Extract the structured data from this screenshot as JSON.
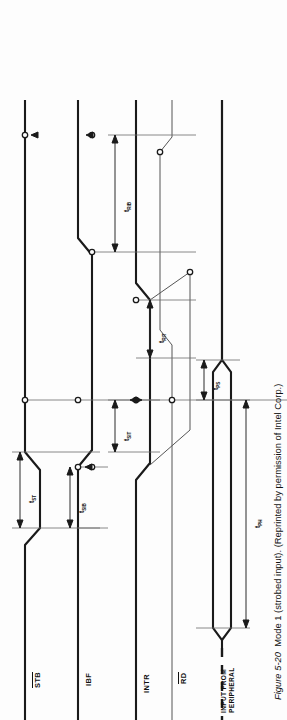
{
  "figure": {
    "number": "Figure 5-20",
    "title": "Mode 1 (strobed input).",
    "credit": "(Reprinted by permission of Intel Corp.)",
    "caption_full": "Figure 5-20   Mode 1 (strobed input). (Reprinted by permission of Intel Corp.)",
    "orientation": "rotated-90-ccw"
  },
  "signals": [
    {
      "id": "stb",
      "label": "STB",
      "overline": true,
      "kind": "waveform"
    },
    {
      "id": "ibf",
      "label": "IBF",
      "overline": false,
      "kind": "waveform"
    },
    {
      "id": "intr",
      "label": "INTR",
      "overline": false,
      "kind": "waveform"
    },
    {
      "id": "rd",
      "label": "RD",
      "overline": true,
      "kind": "waveform"
    },
    {
      "id": "data",
      "label": "INPUT FROM PERIPHERAL",
      "label_line1": "INPUT FROM",
      "label_line2": "PERIPHERAL",
      "overline": false,
      "kind": "data-bus"
    }
  ],
  "timings": [
    {
      "id": "tST",
      "base": "t",
      "sub": "ST",
      "text": "tST",
      "meaning": "STB pulse width"
    },
    {
      "id": "tSIB",
      "base": "t",
      "sub": "SIB",
      "text": "tSIB",
      "meaning": "STB low to IBF high"
    },
    {
      "id": "tSIT",
      "base": "t",
      "sub": "SIT",
      "text": "tSIT",
      "meaning": "STB high to INTR high"
    },
    {
      "id": "tRIT",
      "base": "t",
      "sub": "RIT",
      "text": "tRIT",
      "meaning": "RD low to INTR low"
    },
    {
      "id": "tRIB",
      "base": "t",
      "sub": "RIB",
      "text": "tRIB",
      "meaning": "RD high to IBF low"
    },
    {
      "id": "tPS",
      "base": "t",
      "sub": "PS",
      "text": "tPS",
      "meaning": "peripheral data setup time"
    },
    {
      "id": "tPH",
      "base": "t",
      "sub": "PH",
      "text": "tPH",
      "meaning": "peripheral data hold time"
    }
  ],
  "colors": {
    "ink": "#1a1a1a",
    "reference_line": "#6b6b6b",
    "thin_trace": "#555555",
    "background": "#fdfdfd"
  }
}
